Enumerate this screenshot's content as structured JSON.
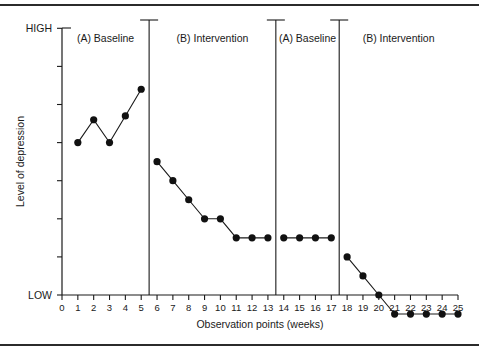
{
  "chart_data": {
    "type": "line",
    "title": "",
    "xlabel": "Observation points (weeks)",
    "ylabel": "Level of depression",
    "y_high_label": "HIGH",
    "y_low_label": "LOW",
    "x_ticks": [
      0,
      1,
      2,
      3,
      4,
      5,
      6,
      7,
      8,
      9,
      10,
      11,
      12,
      13,
      14,
      15,
      16,
      17,
      18,
      19,
      20,
      21,
      22,
      23,
      24,
      25
    ],
    "xlim": [
      0,
      25
    ],
    "ylim": [
      0,
      7
    ],
    "y_ticks": [
      0,
      1,
      2,
      3,
      4,
      5,
      6,
      7
    ],
    "y_tick_labels": [
      "",
      "",
      "",
      "",
      "",
      "",
      "",
      ""
    ],
    "grid": false,
    "legend": "none",
    "marker": "filled-circle",
    "line_color": "#1a1a1a",
    "marker_color": "#111111",
    "phase_lines": [
      5.5,
      13.5,
      17.5
    ],
    "phases": [
      {
        "label": "(A) Baseline",
        "start": 1,
        "end": 5
      },
      {
        "label": "(B) Intervention",
        "start": 6,
        "end": 13
      },
      {
        "label": "(A) Baseline",
        "start": 14,
        "end": 17
      },
      {
        "label": "(B) Intervention",
        "start": 18,
        "end": 25
      }
    ],
    "series": [
      {
        "name": "Level of depression",
        "x": [
          1,
          2,
          3,
          4,
          5,
          6,
          7,
          8,
          9,
          10,
          11,
          12,
          13,
          14,
          15,
          16,
          17,
          18,
          19,
          20,
          21,
          22,
          23,
          24,
          25
        ],
        "values": [
          4.0,
          4.6,
          4.0,
          4.7,
          5.4,
          3.5,
          3.0,
          2.5,
          2.0,
          2.0,
          1.5,
          1.5,
          1.5,
          1.5,
          1.5,
          1.5,
          1.5,
          1.0,
          0.5,
          0.0,
          -0.5,
          -0.5,
          -0.5,
          -0.5,
          -0.5
        ],
        "segments": [
          {
            "phase": "(A) Baseline",
            "x": [
              1,
              2,
              3,
              4,
              5
            ]
          },
          {
            "phase": "(B) Intervention",
            "x": [
              6,
              7,
              8,
              9,
              10,
              11,
              12,
              13
            ]
          },
          {
            "phase": "(A) Baseline",
            "x": [
              14,
              15,
              16,
              17
            ]
          },
          {
            "phase": "(B) Intervention",
            "x": [
              18,
              19,
              20,
              21,
              22,
              23,
              24,
              25
            ]
          }
        ]
      }
    ]
  },
  "figure": {
    "top_rule": true,
    "bottom_rule": true
  }
}
